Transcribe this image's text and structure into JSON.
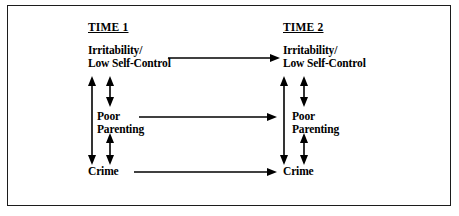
{
  "figure": {
    "type": "path-diagram",
    "border_color": "#1c1c1c",
    "background_color": "#ffffff",
    "line_color": "#000000"
  },
  "columns": [
    {
      "id": "time1",
      "heading": "TIME 1"
    },
    {
      "id": "time2",
      "heading": "TIME 2"
    }
  ],
  "nodes": {
    "time1": {
      "irritability_line1": "Irritability/",
      "irritability_line2": "Low Self-Control",
      "parenting_line1": "Poor",
      "parenting_line2": "Parenting",
      "crime": "Crime"
    },
    "time2": {
      "irritability_line1": "Irritability/",
      "irritability_line2": "Low Self-Control",
      "parenting_line1": "Poor",
      "parenting_line2": "Parenting",
      "crime": "Crime"
    }
  },
  "arrows": {
    "horizontal": [
      {
        "id": "irritability-t1-to-t2",
        "from": "Irritability/Low Self-Control (Time 1)",
        "to": "Irritability/Low Self-Control (Time 2)",
        "style": "single-headed"
      },
      {
        "id": "parenting-t1-to-t2",
        "from": "Poor Parenting (Time 1)",
        "to": "Poor Parenting (Time 2)",
        "style": "single-headed"
      },
      {
        "id": "crime-t1-to-t2",
        "from": "Crime (Time 1)",
        "to": "Crime (Time 2)",
        "style": "single-headed"
      }
    ],
    "vertical": [
      {
        "id": "t1-irritability-crime",
        "between": "Irritability/Low Self-Control (Time 1) and Crime (Time 1)",
        "style": "double-headed"
      },
      {
        "id": "t1-irritability-parenting",
        "between": "Irritability/Low Self-Control (Time 1) and Poor Parenting (Time 1)",
        "style": "double-headed"
      },
      {
        "id": "t1-parenting-crime",
        "between": "Poor Parenting (Time 1) and Crime (Time 1)",
        "style": "double-headed"
      },
      {
        "id": "t2-irritability-crime",
        "between": "Irritability/Low Self-Control (Time 2) and Crime (Time 2)",
        "style": "double-headed"
      },
      {
        "id": "t2-irritability-parenting",
        "between": "Irritability/Low Self-Control (Time 2) and Poor Parenting (Time 2)",
        "style": "double-headed"
      },
      {
        "id": "t2-parenting-crime",
        "between": "Poor Parenting (Time 2) and Crime (Time 2)",
        "style": "double-headed"
      }
    ]
  }
}
